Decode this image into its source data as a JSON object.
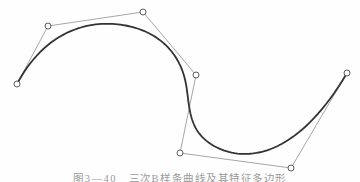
{
  "figure": {
    "caption": "图3—40　三次B样条曲线及其特征多边形",
    "kind": "cubic B-spline curve with control polygon"
  },
  "spline": {
    "degree": 3,
    "clamped": true,
    "control_points": [
      [
        17,
        84
      ],
      [
        48,
        26
      ],
      [
        143,
        12
      ],
      [
        196,
        75
      ],
      [
        180,
        153
      ],
      [
        291,
        168
      ],
      [
        347,
        73
      ]
    ],
    "samples": 160
  },
  "style": {
    "background": "#fefefe",
    "curve_color": "#333333",
    "curve_width": 1.8,
    "polygon_color": "#8f8f8f",
    "polygon_width": 0.8,
    "point_radius": 3,
    "point_stroke": "#5c5c5c",
    "point_stroke_width": 1,
    "point_fill": "#ffffff",
    "caption_color": "#777777"
  }
}
